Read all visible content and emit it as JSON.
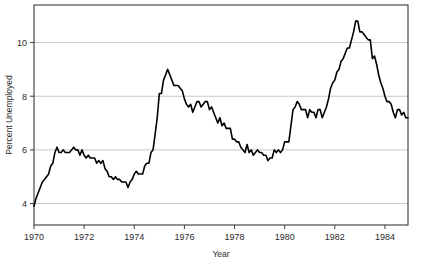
{
  "chart_data": {
    "type": "line",
    "title": "",
    "subtitle": "",
    "xlabel": "Year",
    "ylabel": "Percent Unemployed",
    "xlim": [
      1970.0,
      1984.92
    ],
    "ylim": [
      3.2,
      11.4
    ],
    "grid": true,
    "gridlines_y": [
      4,
      6,
      8,
      10
    ],
    "legend": null,
    "legend_position": "none",
    "x_ticks": [
      1970,
      1972,
      1974,
      1976,
      1978,
      1980,
      1982,
      1984
    ],
    "x_tick_labels": [
      "1970",
      "1972",
      "1974",
      "1976",
      "1978",
      "1980",
      "1982",
      "1984"
    ],
    "y_ticks": [
      4,
      6,
      8,
      10
    ],
    "y_tick_labels": [
      "4",
      "6",
      "8",
      "10"
    ],
    "line_color": "#000000",
    "line_width": 1.6,
    "frame_color": "#3a3a3a",
    "grid_color": "#c8c8c8",
    "background_color": "#ffffff",
    "series": [
      {
        "name": "Percent Unemployed",
        "x_start": 1970.0,
        "x_step": 0.08333,
        "values": [
          3.9,
          4.2,
          4.4,
          4.6,
          4.8,
          4.9,
          5.0,
          5.1,
          5.4,
          5.5,
          5.9,
          6.1,
          5.9,
          5.9,
          6.0,
          5.9,
          5.9,
          5.9,
          6.0,
          6.1,
          6.0,
          6.0,
          5.8,
          6.0,
          5.8,
          5.7,
          5.8,
          5.7,
          5.7,
          5.7,
          5.5,
          5.6,
          5.5,
          5.6,
          5.3,
          5.2,
          5.0,
          5.0,
          4.9,
          5.0,
          4.9,
          4.9,
          4.8,
          4.8,
          4.8,
          4.6,
          4.8,
          4.9,
          5.1,
          5.2,
          5.1,
          5.1,
          5.1,
          5.4,
          5.5,
          5.5,
          5.9,
          6.0,
          6.6,
          7.2,
          8.1,
          8.1,
          8.6,
          8.8,
          9.0,
          8.8,
          8.6,
          8.4,
          8.4,
          8.4,
          8.3,
          8.2,
          7.9,
          7.7,
          7.6,
          7.7,
          7.4,
          7.6,
          7.8,
          7.8,
          7.6,
          7.7,
          7.8,
          7.8,
          7.5,
          7.6,
          7.4,
          7.2,
          7.0,
          7.2,
          6.9,
          7.0,
          6.8,
          6.8,
          6.8,
          6.4,
          6.4,
          6.3,
          6.3,
          6.1,
          6.0,
          5.9,
          6.2,
          5.9,
          6.0,
          5.8,
          5.9,
          6.0,
          5.9,
          5.9,
          5.8,
          5.8,
          5.6,
          5.7,
          5.7,
          6.0,
          5.9,
          6.0,
          5.9,
          6.0,
          6.3,
          6.3,
          6.3,
          6.9,
          7.5,
          7.6,
          7.8,
          7.7,
          7.5,
          7.5,
          7.5,
          7.2,
          7.5,
          7.4,
          7.4,
          7.2,
          7.5,
          7.5,
          7.2,
          7.4,
          7.6,
          7.9,
          8.3,
          8.5,
          8.6,
          8.9,
          9.0,
          9.3,
          9.4,
          9.6,
          9.8,
          9.8,
          10.1,
          10.4,
          10.8,
          10.8,
          10.4,
          10.4,
          10.3,
          10.2,
          10.1,
          10.1,
          9.4,
          9.5,
          9.2,
          8.8,
          8.5,
          8.3,
          8.0,
          7.8,
          7.8,
          7.7,
          7.4,
          7.2,
          7.5,
          7.5,
          7.3,
          7.4,
          7.2,
          7.2
        ]
      }
    ]
  }
}
